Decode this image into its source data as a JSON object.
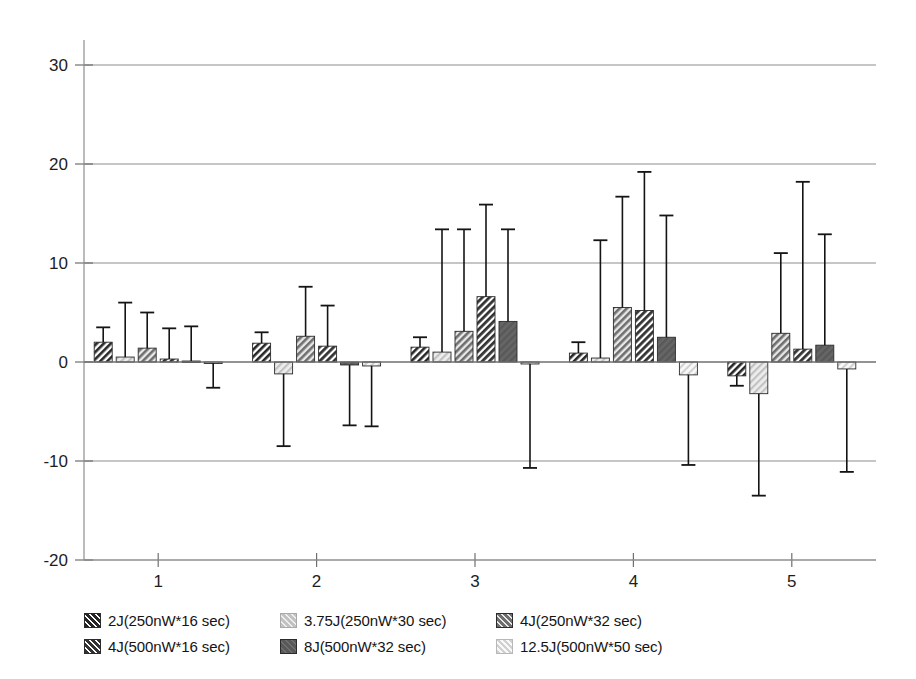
{
  "chart_data": {
    "type": "bar",
    "title": "",
    "subtitle": "",
    "xlabel": "",
    "ylabel": "",
    "grid": true,
    "legend_position": "bottom",
    "orientation": "vertical",
    "error_bars": true,
    "categories": [
      "1",
      "2",
      "3",
      "4",
      "5"
    ],
    "ylim": [
      -20,
      30
    ],
    "yticks": [
      30,
      20,
      10,
      0,
      -10,
      -20
    ],
    "ytick_labels": [
      "30",
      "20",
      "10",
      "0",
      "-10",
      "-20"
    ],
    "xtick_labels": [
      "1",
      "2",
      "3",
      "4",
      "5"
    ],
    "series": [
      {
        "name": "2J(250nW*16 sec)",
        "color": "#2e2e2e",
        "pattern": "diagonal-dark",
        "values": [
          2.0,
          1.9,
          1.5,
          0.9,
          -1.4
        ],
        "errors": [
          1.5,
          1.1,
          1.0,
          1.1,
          1.0
        ]
      },
      {
        "name": "3.75J(250nW*30 sec)",
        "color": "#c9c9c9",
        "pattern": "diagonal-light",
        "values": [
          0.5,
          -1.2,
          1.0,
          0.4,
          -3.2
        ],
        "errors": [
          5.5,
          7.3,
          12.4,
          11.9,
          10.3
        ]
      },
      {
        "name": "4J(250nW*32 sec)",
        "color": "#8f8f8f",
        "pattern": "diagonal-medium",
        "values": [
          1.4,
          2.6,
          3.1,
          5.5,
          2.9
        ],
        "errors": [
          3.6,
          5.0,
          10.3,
          11.2,
          8.1
        ]
      },
      {
        "name": "4J(500nW*16 sec)",
        "color": "#3a3a3a",
        "pattern": "diagonal-dark",
        "values": [
          0.3,
          1.6,
          6.6,
          5.2,
          1.3
        ],
        "errors": [
          3.1,
          4.1,
          9.3,
          14.0,
          16.9
        ]
      },
      {
        "name": "8J(500nW*32 sec)",
        "color": "#6b6b6b",
        "pattern": "solid-gray",
        "values": [
          0.1,
          -0.3,
          4.1,
          2.5,
          1.7
        ],
        "errors": [
          3.5,
          6.1,
          9.3,
          12.3,
          11.2
        ]
      },
      {
        "name": "12.5J(500nW*50 sec)",
        "color": "#d9d9d9",
        "pattern": "diagonal-verylight",
        "values": [
          -0.1,
          -0.4,
          -0.2,
          -1.3,
          -0.7
        ],
        "errors": [
          2.5,
          6.1,
          10.5,
          9.1,
          10.4
        ]
      }
    ]
  },
  "legend": {
    "entries": [
      {
        "label": "2J(250nW*16 sec)"
      },
      {
        "label": "3.75J(250nW*30 sec)"
      },
      {
        "label": "4J(250nW*32 sec)"
      },
      {
        "label": "4J(500nW*16 sec)"
      },
      {
        "label": "8J(500nW*32 sec)"
      },
      {
        "label": "12.5J(500nW*50 sec)"
      }
    ]
  }
}
